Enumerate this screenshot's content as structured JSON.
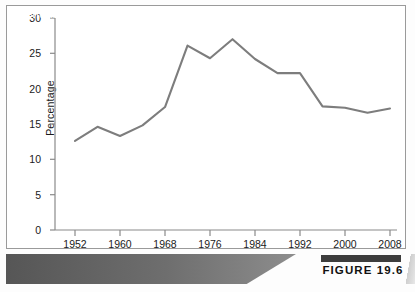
{
  "figure": {
    "caption": "Trend in Split-Ticket Voting, 1952–2008",
    "badge_label": "FIGURE 19.6",
    "line_color": "#7d7d7d",
    "axis_color": "#8a8a8a",
    "text_color": "#1a1a1a",
    "caption_band_color": "#6e6e6e",
    "caption_text_color": "#ffffff"
  },
  "chart_data": {
    "type": "line",
    "title": "Trend in Split-Ticket Voting, 1952–2008",
    "xlabel": "",
    "ylabel": "Percentage",
    "x": [
      1952,
      1956,
      1960,
      1964,
      1968,
      1972,
      1976,
      1980,
      1984,
      1988,
      1992,
      1996,
      2000,
      2004,
      2008
    ],
    "values": [
      12.6,
      14.6,
      13.3,
      14.8,
      17.4,
      26.1,
      24.3,
      27.0,
      24.2,
      22.2,
      22.2,
      17.5,
      17.3,
      16.6,
      17.2
    ],
    "series": [
      {
        "name": "Split-ticket voting",
        "values": [
          12.6,
          14.6,
          13.3,
          14.8,
          17.4,
          26.1,
          24.3,
          27.0,
          24.2,
          22.2,
          22.2,
          17.5,
          17.3,
          16.6,
          17.2
        ]
      }
    ],
    "xlim": [
      1950,
      2010
    ],
    "ylim": [
      0,
      30
    ],
    "yticks": [
      0,
      5,
      10,
      15,
      20,
      25,
      30
    ],
    "ytick_labels": [
      "0",
      "5",
      "10",
      "15",
      "20",
      "25",
      "30"
    ],
    "xticks": [
      1952,
      1960,
      1968,
      1976,
      1984,
      1992,
      2000,
      2008
    ],
    "xtick_labels": [
      "1952",
      "1960",
      "1968",
      "1976",
      "1984",
      "1992",
      "2000",
      "2008"
    ],
    "grid": false,
    "legend": null,
    "legend_position": "none"
  }
}
